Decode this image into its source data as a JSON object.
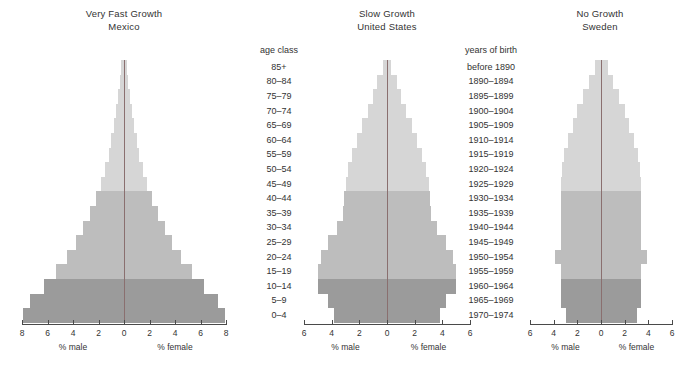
{
  "figure": {
    "background": "#ffffff",
    "axis_color": "#4a4a4a",
    "center_line_color": "#8a6f6f"
  },
  "colors": {
    "young": "#9b9b9b",
    "middle": "#bdbdbd",
    "old": "#d6d6d6"
  },
  "label_columns": {
    "age": {
      "header": "age class",
      "items": [
        "85+",
        "80–84",
        "75–79",
        "70–74",
        "65–69",
        "60–64",
        "55–59",
        "50–54",
        "45–49",
        "40–44",
        "35–39",
        "30–34",
        "25–29",
        "20–24",
        "15–19",
        "10–14",
        "5–9",
        "0–4"
      ]
    },
    "birth": {
      "header": "years of birth",
      "items": [
        "before 1890",
        "1890–1894",
        "1895–1899",
        "1900–1904",
        "1905–1909",
        "1910–1914",
        "1915–1919",
        "1920–1924",
        "1925–1929",
        "1930–1934",
        "1935–1939",
        "1940–1944",
        "1945–1949",
        "1950–1954",
        "1955–1959",
        "1960–1964",
        "1965–1969",
        "1970–1974"
      ]
    }
  },
  "axis_captions": {
    "male": "% male",
    "female": "% female"
  },
  "chart_data": [
    {
      "type": "bar",
      "id": "mexico",
      "title": "Very Fast Growth",
      "subtitle": "Mexico",
      "xlabel_left": "% male",
      "xlabel_right": "% female",
      "ylabel": "age class",
      "xlim": [
        -8,
        8
      ],
      "xticks": [
        -8,
        -6,
        -4,
        -2,
        0,
        2,
        4,
        6,
        8
      ],
      "xticklabels": [
        "8",
        "6",
        "4",
        "2",
        "0",
        "2",
        "4",
        "6",
        "8"
      ],
      "grid": false,
      "legend": "none",
      "categories": [
        "85+",
        "80–84",
        "75–79",
        "70–74",
        "65–69",
        "60–64",
        "55–59",
        "50–54",
        "45–49",
        "40–44",
        "35–39",
        "30–34",
        "25–29",
        "20–24",
        "15–19",
        "10–14",
        "5–9",
        "0–4"
      ],
      "series": [
        {
          "name": "% male",
          "side": "left",
          "values": [
            0.25,
            0.35,
            0.45,
            0.6,
            0.8,
            1.0,
            1.2,
            1.5,
            1.8,
            2.2,
            2.7,
            3.2,
            3.8,
            4.5,
            5.3,
            6.3,
            7.4,
            7.9
          ]
        },
        {
          "name": "% female",
          "side": "right",
          "values": [
            0.25,
            0.35,
            0.45,
            0.6,
            0.8,
            1.0,
            1.2,
            1.5,
            1.8,
            2.2,
            2.7,
            3.2,
            3.8,
            4.5,
            5.3,
            6.3,
            7.4,
            7.9
          ]
        }
      ],
      "band_by_category": [
        "old",
        "old",
        "old",
        "old",
        "old",
        "old",
        "old",
        "old",
        "old",
        "middle",
        "middle",
        "middle",
        "middle",
        "middle",
        "middle",
        "young",
        "young",
        "young"
      ]
    },
    {
      "type": "bar",
      "id": "united-states",
      "title": "Slow Growth",
      "subtitle": "United States",
      "xlabel_left": "% male",
      "xlabel_right": "% female",
      "ylabel": "years of birth",
      "xlim": [
        -6,
        6
      ],
      "xticks": [
        -6,
        -4,
        -2,
        0,
        2,
        4,
        6
      ],
      "xticklabels": [
        "6",
        "4",
        "2",
        "0",
        "2",
        "4",
        "6"
      ],
      "grid": false,
      "legend": "none",
      "categories": [
        "85+",
        "80–84",
        "75–79",
        "70–74",
        "65–69",
        "60–64",
        "55–59",
        "50–54",
        "45–49",
        "40–44",
        "35–39",
        "30–34",
        "25–29",
        "20–24",
        "15–19",
        "10–14",
        "5–9",
        "0–4"
      ],
      "series": [
        {
          "name": "% male",
          "side": "left",
          "values": [
            0.3,
            0.7,
            1.0,
            1.4,
            1.8,
            2.2,
            2.5,
            2.8,
            3.0,
            3.1,
            3.2,
            3.6,
            4.3,
            4.8,
            5.0,
            5.0,
            4.3,
            3.8
          ]
        },
        {
          "name": "% female",
          "side": "right",
          "values": [
            0.3,
            0.7,
            1.0,
            1.4,
            1.8,
            2.2,
            2.5,
            2.8,
            3.0,
            3.1,
            3.2,
            3.6,
            4.3,
            4.8,
            5.0,
            5.0,
            4.3,
            3.8
          ]
        }
      ],
      "band_by_category": [
        "old",
        "old",
        "old",
        "old",
        "old",
        "old",
        "old",
        "old",
        "old",
        "middle",
        "middle",
        "middle",
        "middle",
        "middle",
        "middle",
        "young",
        "young",
        "young"
      ]
    },
    {
      "type": "bar",
      "id": "sweden",
      "title": "No Growth",
      "subtitle": "Sweden",
      "xlabel_left": "% male",
      "xlabel_right": "% female",
      "ylabel": "",
      "xlim": [
        -6,
        6
      ],
      "xticks": [
        -6,
        -4,
        -2,
        0,
        2,
        4,
        6
      ],
      "xticklabels": [
        "6",
        "4",
        "2",
        "0",
        "2",
        "4",
        "6"
      ],
      "grid": false,
      "legend": "none",
      "categories": [
        "85+",
        "80–84",
        "75–79",
        "70–74",
        "65–69",
        "60–64",
        "55–59",
        "50–54",
        "45–49",
        "40–44",
        "35–39",
        "30–34",
        "25–29",
        "20–24",
        "15–19",
        "10–14",
        "5–9",
        "0–4"
      ],
      "series": [
        {
          "name": "% male",
          "side": "left",
          "values": [
            0.55,
            1.0,
            1.5,
            2.0,
            2.4,
            2.8,
            3.1,
            3.3,
            3.4,
            3.4,
            3.4,
            3.4,
            3.4,
            3.9,
            3.4,
            3.4,
            3.4,
            3.0
          ]
        },
        {
          "name": "% female",
          "side": "right",
          "values": [
            0.55,
            1.0,
            1.5,
            2.0,
            2.4,
            2.8,
            3.1,
            3.3,
            3.4,
            3.4,
            3.4,
            3.4,
            3.4,
            3.9,
            3.4,
            3.4,
            3.4,
            3.0
          ]
        }
      ],
      "band_by_category": [
        "old",
        "old",
        "old",
        "old",
        "old",
        "old",
        "old",
        "old",
        "old",
        "middle",
        "middle",
        "middle",
        "middle",
        "middle",
        "middle",
        "young",
        "young",
        "young"
      ]
    }
  ]
}
